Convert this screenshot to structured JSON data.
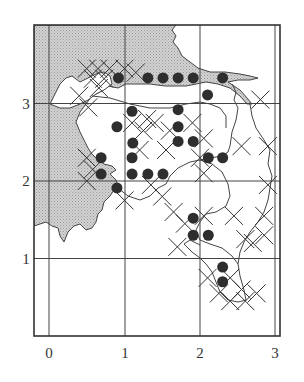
{
  "figure": {
    "type": "distribution-grid-map",
    "x_ticks": [
      "0",
      "1",
      "2",
      "3"
    ],
    "y_ticks": [
      "1",
      "2",
      "3"
    ],
    "colors": {
      "land": "#c9c9c9",
      "water": "#ffffff",
      "line": "#333333",
      "dot": "#2e2e2e"
    },
    "legend_symbols": [
      {
        "name": "filled-circle",
        "meaning": "occurrence point"
      },
      {
        "name": "cross",
        "meaning": "grid occurrence marker"
      }
    ]
  },
  "chart_data": {
    "type": "scatter",
    "title": "",
    "xlabel": "",
    "ylabel": "",
    "xlim": [
      -0.2,
      3.05
    ],
    "ylim": [
      0,
      4.05
    ],
    "x_ticks": [
      0,
      1,
      2,
      3
    ],
    "y_ticks": [
      1,
      2,
      3
    ],
    "grid": true,
    "series": [
      {
        "name": "dots",
        "points": [
          [
            0.92,
            3.33
          ],
          [
            1.31,
            3.33
          ],
          [
            1.51,
            3.33
          ],
          [
            1.71,
            3.33
          ],
          [
            1.91,
            3.33
          ],
          [
            2.3,
            3.33
          ],
          [
            2.1,
            3.11
          ],
          [
            0.9,
            2.7
          ],
          [
            1.1,
            2.9
          ],
          [
            1.11,
            2.49
          ],
          [
            1.1,
            2.3
          ],
          [
            1.1,
            2.09
          ],
          [
            1.31,
            2.09
          ],
          [
            1.51,
            2.09
          ],
          [
            1.71,
            2.92
          ],
          [
            1.71,
            2.7
          ],
          [
            1.71,
            2.51
          ],
          [
            1.91,
            2.51
          ],
          [
            2.11,
            2.3
          ],
          [
            2.3,
            2.3
          ],
          [
            0.69,
            2.3
          ],
          [
            0.69,
            2.09
          ],
          [
            0.9,
            1.91
          ],
          [
            1.91,
            1.52
          ],
          [
            1.91,
            1.3
          ],
          [
            2.11,
            1.3
          ],
          [
            2.3,
            0.89
          ],
          [
            2.3,
            0.7
          ]
        ]
      },
      {
        "name": "crosses",
        "points": [
          [
            0.5,
            3.45
          ],
          [
            0.65,
            3.45
          ],
          [
            0.8,
            3.45
          ],
          [
            0.58,
            3.32
          ],
          [
            0.73,
            3.32
          ],
          [
            0.66,
            3.2
          ],
          [
            1.0,
            3.45
          ],
          [
            1.15,
            3.4
          ],
          [
            0.4,
            3.1
          ],
          [
            0.52,
            2.95
          ],
          [
            1.1,
            2.75
          ],
          [
            1.25,
            2.65
          ],
          [
            1.3,
            2.8
          ],
          [
            1.4,
            2.75
          ],
          [
            1.2,
            2.4
          ],
          [
            1.55,
            2.4
          ],
          [
            1.6,
            2.65
          ],
          [
            1.9,
            2.75
          ],
          [
            2.05,
            2.55
          ],
          [
            2.0,
            2.3
          ],
          [
            2.05,
            2.1
          ],
          [
            2.8,
            3.05
          ],
          [
            2.55,
            2.45
          ],
          [
            2.9,
            2.45
          ],
          [
            0.5,
            2.3
          ],
          [
            0.58,
            2.15
          ],
          [
            0.5,
            2.0
          ],
          [
            1.0,
            1.75
          ],
          [
            1.35,
            1.95
          ],
          [
            1.5,
            1.8
          ],
          [
            1.65,
            1.6
          ],
          [
            1.8,
            1.45
          ],
          [
            2.05,
            1.55
          ],
          [
            2.45,
            1.55
          ],
          [
            2.6,
            1.25
          ],
          [
            2.85,
            1.55
          ],
          [
            2.9,
            1.95
          ],
          [
            2.7,
            1.2
          ],
          [
            2.85,
            1.3
          ],
          [
            1.7,
            1.15
          ],
          [
            2.1,
            0.75
          ],
          [
            2.25,
            0.55
          ],
          [
            2.4,
            0.45
          ],
          [
            2.55,
            0.6
          ],
          [
            2.4,
            0.75
          ],
          [
            2.6,
            0.45
          ],
          [
            2.75,
            0.55
          ]
        ]
      }
    ]
  }
}
